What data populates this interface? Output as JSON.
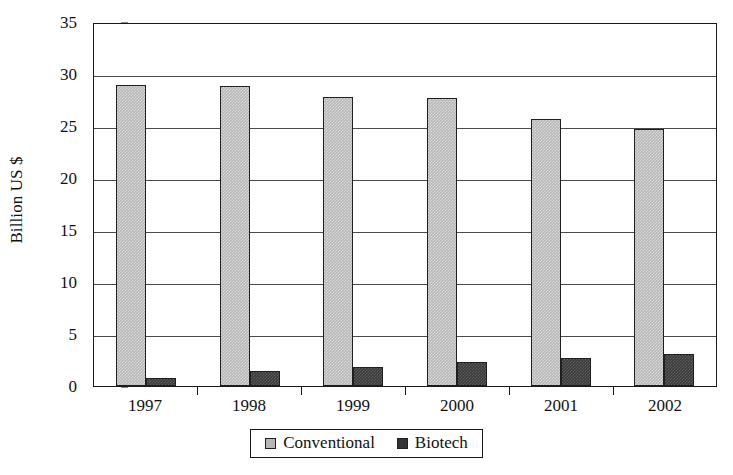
{
  "chart_data": {
    "type": "bar",
    "title": "",
    "subtitle": "",
    "xlabel": "",
    "ylabel": "Billion US $",
    "categories": [
      "1997",
      "1998",
      "1999",
      "2000",
      "2001",
      "2002"
    ],
    "series": [
      {
        "name": "Conventional",
        "color": "#b7b7b7",
        "values": [
          28.9,
          28.8,
          27.8,
          27.7,
          25.7,
          24.7
        ]
      },
      {
        "name": "Biotech",
        "color": "#333333",
        "values": [
          0.8,
          1.4,
          1.8,
          2.3,
          2.7,
          3.1
        ]
      }
    ],
    "ylim": [
      0,
      35
    ],
    "ytick_step": 5,
    "yticks": [
      "0",
      "5",
      "10",
      "15",
      "20",
      "25",
      "30",
      "35"
    ],
    "grid": true,
    "grid_axis": "y",
    "legend": {
      "position": "bottom",
      "bordered": true,
      "entries": [
        "Conventional",
        "Biotech"
      ]
    }
  }
}
